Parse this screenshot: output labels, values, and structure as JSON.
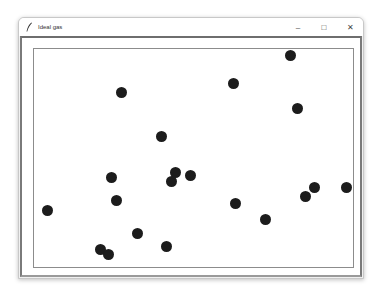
{
  "window": {
    "title": "Ideal gas",
    "icon": "feather-icon",
    "controls": {
      "minimize": "–",
      "maximize": "□",
      "close": "✕"
    }
  },
  "canvas": {
    "box": {
      "left": 33,
      "top": 48,
      "right": 354,
      "bottom": 268,
      "color": "#8c8c8c"
    },
    "ball_color": "#1c1c1c",
    "ball_radius": 5.5,
    "balls": [
      {
        "x": 290,
        "y": 55
      },
      {
        "x": 233,
        "y": 83
      },
      {
        "x": 121,
        "y": 92
      },
      {
        "x": 297,
        "y": 108
      },
      {
        "x": 161,
        "y": 136
      },
      {
        "x": 175,
        "y": 172
      },
      {
        "x": 190,
        "y": 175
      },
      {
        "x": 111,
        "y": 177
      },
      {
        "x": 171,
        "y": 181
      },
      {
        "x": 314,
        "y": 187
      },
      {
        "x": 346,
        "y": 187
      },
      {
        "x": 305,
        "y": 196
      },
      {
        "x": 116,
        "y": 200
      },
      {
        "x": 235,
        "y": 203
      },
      {
        "x": 47,
        "y": 210
      },
      {
        "x": 265,
        "y": 219
      },
      {
        "x": 137,
        "y": 233
      },
      {
        "x": 166,
        "y": 246
      },
      {
        "x": 100,
        "y": 249
      },
      {
        "x": 108,
        "y": 254
      }
    ]
  }
}
